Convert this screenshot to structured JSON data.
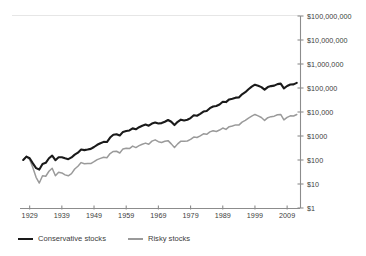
{
  "chart_data": {
    "type": "line",
    "title": "",
    "subtitle": "",
    "xlabel": "",
    "ylabel": "",
    "yscale": "log",
    "ylim": [
      1,
      100000000
    ],
    "xlim": [
      1926,
      2013
    ],
    "grid": false,
    "legend_position": "bottom-left",
    "y_ticks": [
      1,
      10,
      100,
      1000,
      10000,
      100000,
      1000000,
      10000000,
      100000000
    ],
    "y_tick_labels": [
      "$1",
      "$10",
      "$100",
      "$1000",
      "$10,000",
      "$100,000",
      "$1,000,000",
      "$10,000,000",
      "$100,000,000"
    ],
    "x_ticks": [
      1929,
      1939,
      1949,
      1959,
      1969,
      1979,
      1989,
      1999,
      2009
    ],
    "x_tick_labels": [
      "1929",
      "1939",
      "1949",
      "1959",
      "1969",
      "1979",
      "1989",
      "1999",
      "2009"
    ],
    "series": [
      {
        "name": "Conservative stocks",
        "color": "#1a1a1a",
        "width": 2.1,
        "x": [
          1927,
          1928,
          1929,
          1930,
          1931,
          1932,
          1933,
          1934,
          1935,
          1936,
          1937,
          1938,
          1939,
          1940,
          1941,
          1942,
          1943,
          1944,
          1945,
          1946,
          1947,
          1948,
          1949,
          1950,
          1951,
          1952,
          1953,
          1954,
          1955,
          1956,
          1957,
          1958,
          1959,
          1960,
          1961,
          1962,
          1963,
          1964,
          1965,
          1966,
          1967,
          1968,
          1969,
          1970,
          1971,
          1972,
          1973,
          1974,
          1975,
          1976,
          1977,
          1978,
          1979,
          1980,
          1981,
          1982,
          1983,
          1984,
          1985,
          1986,
          1987,
          1988,
          1989,
          1990,
          1991,
          1992,
          1993,
          1994,
          1995,
          1996,
          1997,
          1998,
          1999,
          2000,
          2001,
          2002,
          2003,
          2004,
          2005,
          2006,
          2007,
          2008,
          2009,
          2010,
          2011,
          2012
        ],
        "y": [
          100,
          138,
          118,
          72,
          46,
          40,
          68,
          76,
          118,
          152,
          98,
          130,
          131,
          118,
          108,
          128,
          168,
          202,
          272,
          258,
          272,
          290,
          348,
          430,
          500,
          570,
          560,
          860,
          1120,
          1180,
          1050,
          1480,
          1620,
          1700,
          2080,
          1900,
          2320,
          2690,
          2990,
          2680,
          3290,
          3650,
          3330,
          3450,
          3920,
          4640,
          3930,
          2860,
          3890,
          4800,
          4460,
          4740,
          5580,
          7350,
          6980,
          8400,
          10400,
          11000,
          14400,
          17000,
          17800,
          20600,
          26900,
          25900,
          33500,
          36000,
          39600,
          40000,
          54800,
          67000,
          89000,
          114000,
          137000,
          124000,
          109000,
          85000,
          109000,
          120000,
          126000,
          145000,
          152000,
          96000,
          121000,
          139000,
          141000,
          163000
        ]
      },
      {
        "name": "Risky stocks",
        "color": "#9a9a9a",
        "width": 1.5,
        "x": [
          1927,
          1928,
          1929,
          1930,
          1931,
          1932,
          1933,
          1934,
          1935,
          1936,
          1937,
          1938,
          1939,
          1940,
          1941,
          1942,
          1943,
          1944,
          1945,
          1946,
          1947,
          1948,
          1949,
          1950,
          1951,
          1952,
          1953,
          1954,
          1955,
          1956,
          1957,
          1958,
          1959,
          1960,
          1961,
          1962,
          1963,
          1964,
          1965,
          1966,
          1967,
          1968,
          1969,
          1970,
          1971,
          1972,
          1973,
          1974,
          1975,
          1976,
          1977,
          1978,
          1979,
          1980,
          1981,
          1982,
          1983,
          1984,
          1985,
          1986,
          1987,
          1988,
          1989,
          1990,
          1991,
          1992,
          1993,
          1994,
          1995,
          1996,
          1997,
          1998,
          1999,
          2000,
          2001,
          2002,
          2003,
          2004,
          2005,
          2006,
          2007,
          2008,
          2009,
          2010,
          2011,
          2012
        ],
        "y": [
          100,
          142,
          104,
          48,
          19,
          11,
          22,
          21,
          34,
          45,
          22,
          31,
          29,
          24,
          22,
          27,
          42,
          55,
          78,
          70,
          72,
          71,
          85,
          104,
          117,
          131,
          124,
          186,
          227,
          232,
          196,
          290,
          310,
          300,
          380,
          330,
          395,
          455,
          505,
          450,
          610,
          690,
          580,
          540,
          600,
          640,
          470,
          330,
          470,
          610,
          600,
          620,
          720,
          900,
          870,
          1010,
          1230,
          1170,
          1480,
          1660,
          1540,
          1770,
          2150,
          1880,
          2450,
          2620,
          2900,
          2850,
          3800,
          4500,
          5600,
          6700,
          7900,
          6900,
          5900,
          4450,
          5800,
          6400,
          6700,
          7700,
          7900,
          4700,
          6000,
          6900,
          6800,
          7900
        ]
      }
    ]
  },
  "legend": {
    "items": [
      {
        "label": "Conservative stocks"
      },
      {
        "label": "Risky stocks"
      }
    ]
  }
}
